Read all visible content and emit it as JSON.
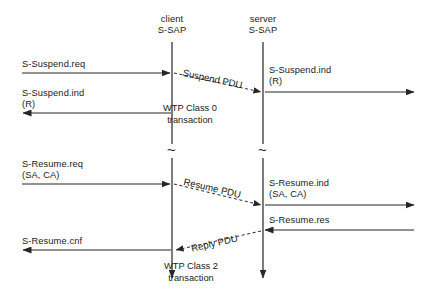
{
  "diagram": {
    "type": "sequence-diagram",
    "colors": {
      "line": "#262626",
      "text": "#1a1a1a",
      "background": "#ffffff"
    },
    "lifelines": [
      {
        "id": "client",
        "name_line1": "client",
        "name_line2": "S-SAP",
        "x": 172
      },
      {
        "id": "server",
        "name_line1": "server",
        "name_line2": "S-SAP",
        "x": 263
      }
    ],
    "break_marker": "~",
    "sections": [
      {
        "id": "suspend",
        "caption_line1": "WTP Class 0",
        "caption_line2": "transaction"
      },
      {
        "id": "resume",
        "caption_line1": "WTP Class 2",
        "caption_line2": "transaction"
      }
    ],
    "primitives": [
      {
        "id": "s-suspend-req",
        "label_line1": "S-Suspend.req",
        "label_line2": ""
      },
      {
        "id": "s-suspend-ind-right",
        "label_line1": "S-Suspend.ind",
        "label_line2": "(R)"
      },
      {
        "id": "s-suspend-ind-left",
        "label_line1": "S-Suspend.ind",
        "label_line2": "(R)"
      },
      {
        "id": "s-resume-req",
        "label_line1": "S-Resume.req",
        "label_line2": "(SA, CA)"
      },
      {
        "id": "s-resume-ind",
        "label_line1": "S-Resume.ind",
        "label_line2": "(SA, CA)"
      },
      {
        "id": "s-resume-res",
        "label_line1": "S-Resume.res",
        "label_line2": ""
      },
      {
        "id": "s-resume-cnf",
        "label_line1": "S-Resume.cnf",
        "label_line2": ""
      }
    ],
    "pdus": [
      {
        "id": "suspend-pdu",
        "label": "Suspend PDU",
        "direction": "client-to-server"
      },
      {
        "id": "resume-pdu",
        "label": "Resume PDU",
        "direction": "client-to-server"
      },
      {
        "id": "reply-pdu",
        "label": "Reply PDU",
        "direction": "server-to-client"
      }
    ]
  }
}
